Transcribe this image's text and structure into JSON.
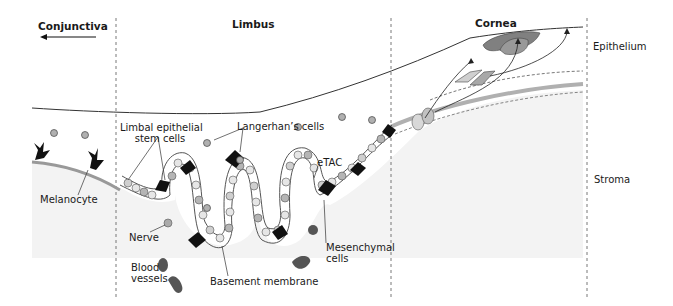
{
  "regions": {
    "conjunctiva": "Conjunctiva",
    "limbus": "Limbus",
    "cornea": "Cornea"
  },
  "layers": {
    "epithelium": "Epithelium",
    "stroma": "Stroma"
  },
  "labels": {
    "limbal_stem_cells_line1": "Limbal epithelial",
    "limbal_stem_cells_line2": "stem cells",
    "langerhans": "Langerhan’s cells",
    "etac": "eTAC",
    "melanocyte": "Melanocyte",
    "nerve": "Nerve",
    "blood_vessels_line1": "Blood",
    "blood_vessels_line2": "vessels",
    "basement_membrane": "Basement membrane",
    "mesenchymal_line1": "Mesenchymal",
    "mesenchymal_line2": "cells"
  },
  "colors": {
    "line": "#333333",
    "cell_light": "#e6e6e6",
    "cell_mid": "#b5b5b5",
    "cell_dark": "#8a8a8a",
    "melanocyte": "#111111",
    "vessel": "#555555",
    "stroma_fill": "#f4f4f4",
    "membrane": "#9a9a9a"
  }
}
